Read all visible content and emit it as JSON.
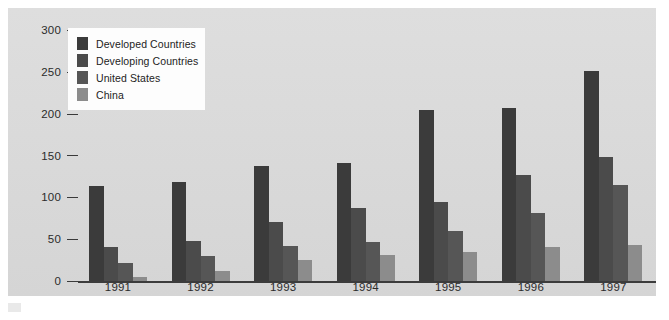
{
  "chart_data": {
    "type": "bar",
    "title": "",
    "subtitle": "",
    "xlabel": "",
    "ylabel": "",
    "categories": [
      "1991",
      "1992",
      "1993",
      "1994",
      "1995",
      "1996",
      "1997"
    ],
    "ylim": [
      0,
      300
    ],
    "yticks": [
      0,
      50,
      100,
      150,
      200,
      250,
      300
    ],
    "ytick_labels": [
      "0",
      "50",
      "100",
      "150",
      "200",
      "250",
      "300"
    ],
    "grid": false,
    "legend_position": "top-left",
    "series": [
      {
        "name": "Developed Countries",
        "color": "#3b3b3b",
        "values": [
          114,
          119,
          138,
          142,
          205,
          207,
          251
        ]
      },
      {
        "name": "Developing Countries",
        "color": "#4b4b4b",
        "values": [
          41,
          48,
          71,
          88,
          95,
          127,
          149
        ]
      },
      {
        "name": "United States",
        "color": "#565656",
        "values": [
          22,
          30,
          42,
          47,
          60,
          82,
          115
        ]
      },
      {
        "name": "China",
        "color": "#8c8c8c",
        "values": [
          5,
          13,
          26,
          31,
          35,
          41,
          44
        ]
      }
    ]
  },
  "figure": {
    "panel_background": "#dcdcdc",
    "legend_background": "#fdfdfd",
    "axis_color": "#3c3c3c",
    "text_color": "#2b2b2b"
  }
}
